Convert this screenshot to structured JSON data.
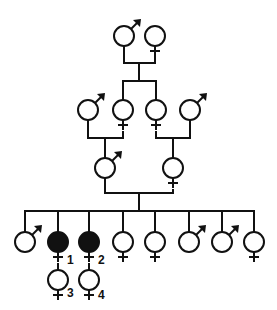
{
  "diagram": {
    "type": "pedigree",
    "colors": {
      "line": "#111111",
      "affected_fill": "#111111",
      "unaffected_fill": "#ffffff"
    },
    "individuals": [
      {
        "id": "g1m",
        "sex": "male",
        "x": 124,
        "y": 36,
        "affected": false,
        "label": ""
      },
      {
        "id": "g1f",
        "sex": "female",
        "x": 155,
        "y": 36,
        "affected": false,
        "label": ""
      },
      {
        "id": "g2m1",
        "sex": "male",
        "x": 88,
        "y": 110,
        "affected": false,
        "label": ""
      },
      {
        "id": "g2f1",
        "sex": "female",
        "x": 123,
        "y": 110,
        "affected": false,
        "label": ""
      },
      {
        "id": "g2f2",
        "sex": "female",
        "x": 156,
        "y": 110,
        "affected": false,
        "label": ""
      },
      {
        "id": "g2m2",
        "sex": "male",
        "x": 190,
        "y": 110,
        "affected": false,
        "label": ""
      },
      {
        "id": "g3m",
        "sex": "male",
        "x": 105,
        "y": 168,
        "affected": false,
        "label": ""
      },
      {
        "id": "g3f",
        "sex": "female",
        "x": 173,
        "y": 168,
        "affected": false,
        "label": ""
      },
      {
        "id": "g4m1",
        "sex": "male",
        "x": 25,
        "y": 242,
        "affected": false,
        "label": ""
      },
      {
        "id": "g4f1",
        "sex": "female",
        "x": 58,
        "y": 242,
        "affected": true,
        "label": "1"
      },
      {
        "id": "g4f2",
        "sex": "female",
        "x": 89,
        "y": 242,
        "affected": true,
        "label": "2"
      },
      {
        "id": "g4f3",
        "sex": "female",
        "x": 123,
        "y": 242,
        "affected": false,
        "label": ""
      },
      {
        "id": "g4f4",
        "sex": "female",
        "x": 155,
        "y": 242,
        "affected": false,
        "label": ""
      },
      {
        "id": "g4m2",
        "sex": "male",
        "x": 189,
        "y": 242,
        "affected": false,
        "label": ""
      },
      {
        "id": "g4m3",
        "sex": "male",
        "x": 222,
        "y": 242,
        "affected": false,
        "label": ""
      },
      {
        "id": "g4f5",
        "sex": "female",
        "x": 254,
        "y": 242,
        "affected": false,
        "label": ""
      },
      {
        "id": "g5f1",
        "sex": "female",
        "x": 58,
        "y": 280,
        "affected": false,
        "label": "3"
      },
      {
        "id": "g5f2",
        "sex": "female",
        "x": 89,
        "y": 280,
        "affected": false,
        "label": "4"
      }
    ],
    "labels": [
      {
        "text": "1",
        "x": 67,
        "y": 264
      },
      {
        "text": "2",
        "x": 98,
        "y": 264
      },
      {
        "text": "3",
        "x": 67,
        "y": 297
      },
      {
        "text": "4",
        "x": 98,
        "y": 299
      }
    ]
  }
}
